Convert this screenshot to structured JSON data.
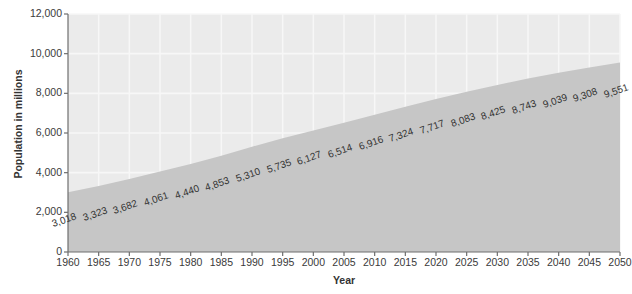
{
  "chart_data": {
    "type": "area",
    "title": "",
    "xlabel": "Year",
    "ylabel": "Population in millions",
    "xlim": [
      1960,
      2050
    ],
    "ylim": [
      0,
      12000
    ],
    "grid": true,
    "legend": "none",
    "categories": [
      1960,
      1965,
      1970,
      1975,
      1980,
      1985,
      1990,
      1995,
      2000,
      2005,
      2010,
      2015,
      2020,
      2025,
      2030,
      2035,
      2040,
      2045,
      2050
    ],
    "values": [
      3018,
      3323,
      3682,
      4061,
      4440,
      4853,
      5310,
      5735,
      6127,
      6514,
      6916,
      7324,
      7717,
      8083,
      8425,
      8743,
      9039,
      9308,
      9551
    ],
    "data_labels": [
      "3,018",
      "3,323",
      "3,682",
      "4,061",
      "4,440",
      "4,853",
      "5,310",
      "5,735",
      "6,127",
      "6,514",
      "6,916",
      "7,324",
      "7,717",
      "8,083",
      "8,425",
      "8,743",
      "9,039",
      "9,308",
      "9,551"
    ],
    "xtick_labels": [
      "1960",
      "1965",
      "1970",
      "1975",
      "1980",
      "1985",
      "1990",
      "1995",
      "2000",
      "2005",
      "2010",
      "2015",
      "2020",
      "2025",
      "2030",
      "2035",
      "2040",
      "2045",
      "2050"
    ],
    "ytick_values": [
      0,
      2000,
      4000,
      6000,
      8000,
      10000,
      12000
    ],
    "ytick_labels": [
      "0",
      "2,000",
      "4,000",
      "6,000",
      "8,000",
      "10,000",
      "12,000"
    ],
    "colors": {
      "plot_background": "#ebebeb",
      "area_fill": "#c6c6c6",
      "gridline": "#f7f7f7",
      "axis_line": "#6e6e6e",
      "text": "#333333",
      "page_background": "#ffffff"
    }
  }
}
